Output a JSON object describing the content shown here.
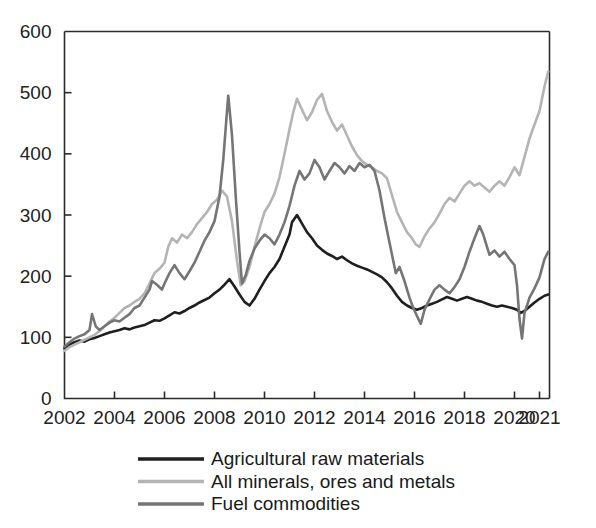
{
  "chart_data": {
    "type": "line",
    "title": "",
    "subtitle": "",
    "xlabel": "",
    "ylabel": "",
    "xlim": [
      2002,
      2021.4
    ],
    "ylim": [
      0,
      600
    ],
    "grid": false,
    "legend_position": "bottom-left",
    "y_ticks": [
      0,
      100,
      200,
      300,
      400,
      500,
      600
    ],
    "x_ticks": [
      2002,
      2004,
      2006,
      2008,
      2010,
      2012,
      2014,
      2016,
      2018,
      2020,
      2021
    ],
    "x_tick_labels": [
      "2002",
      "2004",
      "2006",
      "2008",
      "2010",
      "2012",
      "2014",
      "2016",
      "2018",
      "2020",
      "2021"
    ],
    "y_tick_labels": [
      "0",
      "100",
      "200",
      "300",
      "400",
      "500",
      "600"
    ],
    "colors": {
      "agricultural": "#1f1f1f",
      "minerals": "#b4b4b4",
      "fuel": "#757575"
    },
    "series": [
      {
        "name": "Agricultural raw materials",
        "color": "#1f1f1f",
        "width": 2.6,
        "x": [
          2002.0,
          2002.2,
          2002.4,
          2002.6,
          2002.8,
          2003.0,
          2003.2,
          2003.4,
          2003.6,
          2003.8,
          2004.0,
          2004.2,
          2004.4,
          2004.6,
          2004.8,
          2005.0,
          2005.2,
          2005.4,
          2005.6,
          2005.8,
          2006.0,
          2006.2,
          2006.4,
          2006.6,
          2006.8,
          2007.0,
          2007.2,
          2007.4,
          2007.6,
          2007.8,
          2008.0,
          2008.2,
          2008.4,
          2008.6,
          2008.8,
          2009.0,
          2009.2,
          2009.4,
          2009.6,
          2009.8,
          2010.0,
          2010.2,
          2010.4,
          2010.6,
          2010.8,
          2011.0,
          2011.1,
          2011.3,
          2011.5,
          2011.7,
          2011.9,
          2012.1,
          2012.3,
          2012.5,
          2012.7,
          2012.9,
          2013.1,
          2013.3,
          2013.5,
          2013.7,
          2013.9,
          2014.1,
          2014.3,
          2014.5,
          2014.7,
          2014.9,
          2015.1,
          2015.3,
          2015.5,
          2015.7,
          2015.9,
          2016.1,
          2016.3,
          2016.5,
          2016.7,
          2016.9,
          2017.1,
          2017.3,
          2017.5,
          2017.7,
          2017.9,
          2018.1,
          2018.3,
          2018.5,
          2018.7,
          2018.9,
          2019.1,
          2019.3,
          2019.5,
          2019.7,
          2019.9,
          2020.1,
          2020.25,
          2020.4,
          2020.6,
          2020.8,
          2021.0,
          2021.2,
          2021.35
        ],
        "y": [
          82,
          88,
          92,
          95,
          93,
          97,
          99,
          102,
          105,
          108,
          110,
          112,
          115,
          113,
          116,
          118,
          120,
          124,
          128,
          127,
          131,
          136,
          141,
          139,
          143,
          148,
          152,
          157,
          161,
          165,
          172,
          178,
          186,
          195,
          183,
          170,
          158,
          152,
          163,
          178,
          192,
          205,
          215,
          228,
          248,
          268,
          288,
          300,
          286,
          272,
          262,
          250,
          243,
          237,
          233,
          228,
          232,
          226,
          221,
          217,
          214,
          211,
          207,
          203,
          198,
          190,
          180,
          168,
          158,
          152,
          148,
          145,
          148,
          152,
          155,
          158,
          162,
          166,
          163,
          160,
          163,
          166,
          163,
          160,
          158,
          155,
          152,
          150,
          152,
          150,
          148,
          145,
          140,
          143,
          150,
          157,
          163,
          168,
          170
        ]
      },
      {
        "name": "All minerals, ores and metals",
        "color": "#b4b4b4",
        "width": 2.6,
        "x": [
          2002.0,
          2002.2,
          2002.4,
          2002.6,
          2002.8,
          2003.0,
          2003.2,
          2003.4,
          2003.6,
          2003.8,
          2004.0,
          2004.2,
          2004.4,
          2004.6,
          2004.8,
          2005.0,
          2005.2,
          2005.4,
          2005.6,
          2005.8,
          2006.0,
          2006.15,
          2006.3,
          2006.5,
          2006.7,
          2006.9,
          2007.1,
          2007.3,
          2007.5,
          2007.7,
          2007.9,
          2008.1,
          2008.3,
          2008.5,
          2008.7,
          2008.9,
          2009.05,
          2009.2,
          2009.4,
          2009.6,
          2009.8,
          2010.0,
          2010.2,
          2010.4,
          2010.6,
          2010.8,
          2011.0,
          2011.15,
          2011.3,
          2011.5,
          2011.7,
          2011.9,
          2012.1,
          2012.3,
          2012.5,
          2012.7,
          2012.9,
          2013.1,
          2013.3,
          2013.5,
          2013.7,
          2013.9,
          2014.1,
          2014.3,
          2014.5,
          2014.7,
          2014.9,
          2015.1,
          2015.3,
          2015.5,
          2015.7,
          2015.9,
          2016.05,
          2016.2,
          2016.4,
          2016.6,
          2016.8,
          2017.0,
          2017.2,
          2017.4,
          2017.6,
          2017.8,
          2018.0,
          2018.2,
          2018.4,
          2018.6,
          2018.8,
          2019.0,
          2019.2,
          2019.4,
          2019.6,
          2019.8,
          2020.0,
          2020.2,
          2020.4,
          2020.6,
          2020.8,
          2021.0,
          2021.2,
          2021.35
        ],
        "y": [
          78,
          84,
          88,
          92,
          96,
          100,
          104,
          110,
          118,
          126,
          132,
          140,
          148,
          152,
          158,
          163,
          172,
          188,
          205,
          212,
          222,
          248,
          262,
          255,
          268,
          262,
          272,
          285,
          295,
          305,
          318,
          325,
          340,
          330,
          290,
          225,
          185,
          192,
          215,
          248,
          278,
          305,
          318,
          335,
          362,
          400,
          440,
          468,
          490,
          472,
          455,
          468,
          488,
          498,
          470,
          452,
          438,
          448,
          430,
          412,
          398,
          388,
          382,
          378,
          372,
          368,
          360,
          332,
          305,
          288,
          272,
          262,
          252,
          248,
          265,
          278,
          288,
          302,
          318,
          328,
          322,
          335,
          348,
          355,
          348,
          352,
          345,
          338,
          348,
          355,
          348,
          362,
          378,
          365,
          395,
          425,
          448,
          470,
          510,
          535
        ]
      },
      {
        "name": "Fuel commodities",
        "color": "#757575",
        "width": 2.6,
        "x": [
          2002.0,
          2002.2,
          2002.4,
          2002.6,
          2002.8,
          2003.0,
          2003.1,
          2003.25,
          2003.4,
          2003.6,
          2003.8,
          2004.0,
          2004.2,
          2004.4,
          2004.6,
          2004.8,
          2005.0,
          2005.2,
          2005.4,
          2005.5,
          2005.7,
          2005.9,
          2006.0,
          2006.2,
          2006.4,
          2006.6,
          2006.8,
          2007.0,
          2007.2,
          2007.4,
          2007.6,
          2007.8,
          2008.0,
          2008.2,
          2008.35,
          2008.5,
          2008.55,
          2008.7,
          2008.85,
          2009.0,
          2009.1,
          2009.25,
          2009.4,
          2009.6,
          2009.8,
          2010.0,
          2010.2,
          2010.4,
          2010.6,
          2010.8,
          2011.0,
          2011.2,
          2011.4,
          2011.6,
          2011.8,
          2012.0,
          2012.2,
          2012.4,
          2012.6,
          2012.8,
          2013.0,
          2013.2,
          2013.4,
          2013.6,
          2013.8,
          2014.0,
          2014.2,
          2014.4,
          2014.6,
          2014.8,
          2014.95,
          2015.1,
          2015.25,
          2015.4,
          2015.6,
          2015.8,
          2015.95,
          2016.1,
          2016.25,
          2016.4,
          2016.6,
          2016.8,
          2017.0,
          2017.2,
          2017.4,
          2017.6,
          2017.8,
          2018.0,
          2018.2,
          2018.4,
          2018.6,
          2018.75,
          2018.9,
          2019.0,
          2019.2,
          2019.4,
          2019.6,
          2019.8,
          2020.0,
          2020.1,
          2020.2,
          2020.3,
          2020.4,
          2020.5,
          2020.6,
          2020.8,
          2021.0,
          2021.2,
          2021.35
        ],
        "y": [
          85,
          92,
          98,
          102,
          105,
          112,
          138,
          118,
          112,
          118,
          124,
          128,
          126,
          132,
          138,
          148,
          152,
          165,
          178,
          192,
          186,
          178,
          188,
          205,
          218,
          205,
          195,
          208,
          222,
          240,
          258,
          272,
          290,
          330,
          390,
          470,
          495,
          430,
          330,
          240,
          188,
          202,
          225,
          245,
          258,
          268,
          262,
          252,
          268,
          288,
          315,
          348,
          372,
          358,
          368,
          390,
          378,
          358,
          372,
          385,
          378,
          368,
          380,
          372,
          385,
          378,
          382,
          372,
          340,
          295,
          265,
          235,
          205,
          215,
          192,
          165,
          148,
          135,
          122,
          145,
          162,
          178,
          185,
          178,
          172,
          182,
          195,
          215,
          240,
          262,
          282,
          268,
          248,
          235,
          242,
          232,
          240,
          228,
          218,
          185,
          130,
          98,
          140,
          152,
          165,
          180,
          198,
          228,
          240
        ]
      }
    ],
    "legend": [
      {
        "label": "Agricultural raw materials",
        "color": "#1f1f1f"
      },
      {
        "label": "All minerals, ores and metals",
        "color": "#b4b4b4"
      },
      {
        "label": "Fuel commodities",
        "color": "#757575"
      }
    ]
  }
}
